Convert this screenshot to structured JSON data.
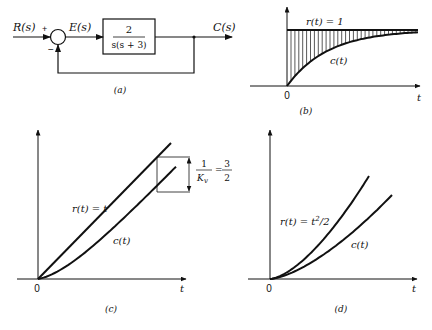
{
  "panel_a": {
    "caption": "(a)",
    "input_label": "R(s)",
    "error_label": "E(s)",
    "output_label": "C(s)",
    "plus_sign": "+",
    "minus_sign": "−",
    "block_numerator": "2",
    "block_denominator": "s(s + 3)"
  },
  "panel_b": {
    "caption": "(b)",
    "reference_label": "r(t) = 1",
    "response_label": "c(t)",
    "origin_label": "0",
    "x_axis_label": "t"
  },
  "panel_c": {
    "caption": "(c)",
    "reference_label": "r(t) = t",
    "response_label": "c(t)",
    "origin_label": "0",
    "x_axis_label": "t",
    "error_fraction_num": "1",
    "error_fraction_den": "K",
    "error_fraction_den_sub": "v",
    "error_equals": "=",
    "error_value_num": "3",
    "error_value_den": "2"
  },
  "panel_d": {
    "caption": "(d)",
    "reference_label_prefix": "r(t) = t",
    "reference_label_sup": "2",
    "reference_label_suffix": "/2",
    "response_label": "c(t)",
    "origin_label": "0",
    "x_axis_label": "t"
  }
}
